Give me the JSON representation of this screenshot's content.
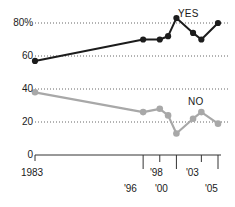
{
  "chart_data": {
    "type": "line",
    "title": "",
    "subtitle": "",
    "xlabel": "",
    "ylabel": "",
    "x": [
      1983,
      1996,
      1998,
      1999,
      2000,
      2002,
      2003,
      2005
    ],
    "x_tick_labels": [
      "1983",
      "'96",
      "'98",
      "'00",
      "'03",
      "'05"
    ],
    "x_tick_values": [
      1983,
      1996,
      1998,
      2000,
      2003,
      2005
    ],
    "y_tick_labels": [
      "0",
      "20",
      "40",
      "60",
      "80%"
    ],
    "y_tick_values": [
      0,
      20,
      40,
      60,
      80
    ],
    "ylim": [
      0,
      88
    ],
    "xlim": [
      1982,
      2006
    ],
    "grid": "horizontal-dotted",
    "legend": "inline-annotations",
    "series": [
      {
        "name": "YES",
        "label": "YES",
        "color": "#1c1c1c",
        "marker": "circle",
        "values": [
          57,
          70,
          70,
          72,
          83,
          74,
          70,
          80
        ]
      },
      {
        "name": "NO",
        "label": "NO",
        "color": "#a8a8a8",
        "marker": "circle",
        "values": [
          38,
          26,
          28,
          24,
          13,
          22,
          26,
          19
        ]
      }
    ],
    "annotations": [
      {
        "text": "YES",
        "series": "YES"
      },
      {
        "text": "NO",
        "series": "NO"
      }
    ]
  },
  "colors": {
    "yes_series": "#1c1c1c",
    "no_series": "#a8a8a8",
    "axis": "#333333",
    "grid": "#555555",
    "text": "#1a1a1a",
    "background": "#ffffff"
  }
}
